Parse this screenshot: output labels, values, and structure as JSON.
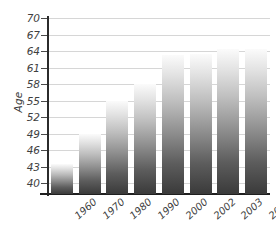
{
  "chart_data": {
    "type": "bar",
    "title": "",
    "xlabel": "",
    "ylabel": "Age",
    "categories": [
      "1960",
      "1970",
      "1980",
      "1990",
      "2000",
      "2002",
      "2003",
      "2004"
    ],
    "values": [
      43.5,
      49.0,
      55.0,
      58.0,
      63.3,
      63.4,
      64.3,
      64.3
    ],
    "ylim": [
      40,
      70
    ],
    "ytick_labels": [
      "40",
      "43",
      "46",
      "49",
      "52",
      "55",
      "58",
      "61",
      "64",
      "67",
      "70"
    ],
    "ytick_values": [
      40,
      43,
      46,
      49,
      52,
      55,
      58,
      61,
      64,
      67,
      70
    ],
    "grid": true,
    "legend": "none",
    "series": [
      {
        "name": "Age",
        "values": [
          43.5,
          49.0,
          55.0,
          58.0,
          63.3,
          63.4,
          64.3,
          64.3
        ]
      }
    ],
    "colors": {
      "bar_top": "#fbfbfb",
      "bar_bottom": "#3a3a3a",
      "gridline": "#d6d6d6",
      "axis": "#2b2b2b",
      "tick_text": "#3f3f3f"
    }
  }
}
